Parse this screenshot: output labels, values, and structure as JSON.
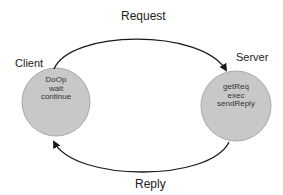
{
  "diagram": {
    "arrows": {
      "request": {
        "label": "Request"
      },
      "reply": {
        "label": "Reply"
      }
    },
    "nodes": {
      "client": {
        "label": "Client",
        "steps": [
          "DoOp",
          "wait",
          "continue"
        ]
      },
      "server": {
        "label": "Server",
        "steps": [
          "getReq",
          "exec",
          "sendReply"
        ]
      }
    },
    "colors": {
      "node_fill": "#c8c8c8",
      "node_stroke": "#a8a8a8",
      "arrow": "#1a1a1a",
      "text": "#222222"
    }
  }
}
